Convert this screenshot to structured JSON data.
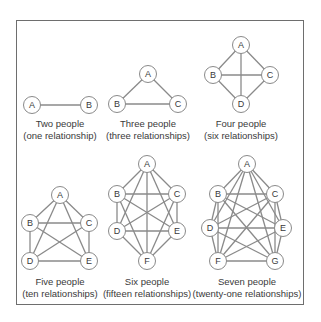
{
  "colors": {
    "edge": "#8a8a8a",
    "node_stroke": "#8a8a8a",
    "node_fill": "#ffffff",
    "text": "#3a3a3a",
    "frame": "#6e6e6e"
  },
  "node_radius": 8.5,
  "graphs": [
    {
      "id": "two",
      "title": "Two people",
      "subtitle": "(one relationship)",
      "caption_x": 60,
      "caption_y": 118,
      "nodes": [
        {
          "label": "A",
          "x": 32,
          "y": 105
        },
        {
          "label": "B",
          "x": 89,
          "y": 105
        }
      ]
    },
    {
      "id": "three",
      "title": "Three people",
      "subtitle": "(three relationships)",
      "caption_x": 148,
      "caption_y": 118,
      "nodes": [
        {
          "label": "A",
          "x": 148,
          "y": 74
        },
        {
          "label": "B",
          "x": 117,
          "y": 104
        },
        {
          "label": "C",
          "x": 178,
          "y": 104
        }
      ]
    },
    {
      "id": "four",
      "title": "Four people",
      "subtitle": "(six relationships)",
      "caption_x": 241,
      "caption_y": 118,
      "nodes": [
        {
          "label": "A",
          "x": 241,
          "y": 45
        },
        {
          "label": "B",
          "x": 213,
          "y": 75
        },
        {
          "label": "C",
          "x": 270,
          "y": 75
        },
        {
          "label": "D",
          "x": 241,
          "y": 104
        }
      ]
    },
    {
      "id": "five",
      "title": "Five people",
      "subtitle": "(ten relationships)",
      "caption_x": 60,
      "caption_y": 276,
      "nodes": [
        {
          "label": "A",
          "x": 60,
          "y": 195
        },
        {
          "label": "B",
          "x": 30,
          "y": 223
        },
        {
          "label": "C",
          "x": 89,
          "y": 223
        },
        {
          "label": "D",
          "x": 30,
          "y": 261
        },
        {
          "label": "E",
          "x": 89,
          "y": 261
        }
      ]
    },
    {
      "id": "six",
      "title": "Six people",
      "subtitle": "(fifteen relationships)",
      "caption_x": 147,
      "caption_y": 276,
      "nodes": [
        {
          "label": "A",
          "x": 147,
          "y": 164
        },
        {
          "label": "B",
          "x": 117,
          "y": 194
        },
        {
          "label": "C",
          "x": 177,
          "y": 194
        },
        {
          "label": "D",
          "x": 117,
          "y": 231
        },
        {
          "label": "E",
          "x": 177,
          "y": 231
        },
        {
          "label": "F",
          "x": 147,
          "y": 261
        }
      ]
    },
    {
      "id": "seven",
      "title": "Seven people",
      "subtitle": "(twenty-one relationships)",
      "caption_x": 247,
      "caption_y": 276,
      "nodes": [
        {
          "label": "A",
          "x": 247,
          "y": 164
        },
        {
          "label": "B",
          "x": 218,
          "y": 194
        },
        {
          "label": "C",
          "x": 275,
          "y": 194
        },
        {
          "label": "D",
          "x": 210,
          "y": 228
        },
        {
          "label": "E",
          "x": 283,
          "y": 228
        },
        {
          "label": "F",
          "x": 218,
          "y": 261
        },
        {
          "label": "G",
          "x": 275,
          "y": 261
        }
      ]
    }
  ]
}
